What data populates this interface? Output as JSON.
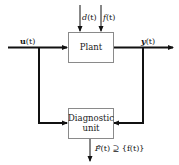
{
  "diagram": {
    "type": "block-diagram",
    "blocks": {
      "plant": {
        "label": "Plant"
      },
      "diagnostic": {
        "line1": "Diagnostic",
        "line2": "unit"
      }
    },
    "signals": {
      "input": {
        "label": "u(t)",
        "symbol": "u",
        "arg": "(t)"
      },
      "output": {
        "label": "y(t)",
        "symbol": "y",
        "arg": "(t)"
      },
      "disturbance": {
        "label": "d(t)",
        "symbol": "d",
        "arg": "(t)"
      },
      "fault": {
        "label": "f(t)",
        "symbol": "f",
        "arg": "(t)"
      },
      "diagnosis": {
        "label": "F̂(t) ⊇ {f(t)}",
        "symbol": "F̂",
        "rest": "(t) ⊇ {f(t)}"
      }
    },
    "colors": {
      "line": "#111111",
      "box_border": "#8a8a8a",
      "background": "#ffffff"
    }
  }
}
